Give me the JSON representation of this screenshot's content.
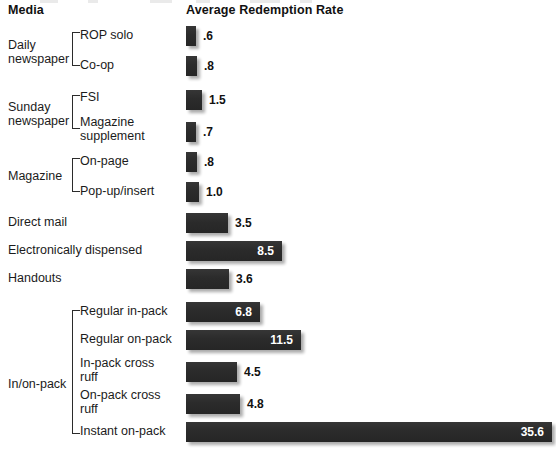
{
  "header": {
    "media_label": "Media",
    "value_label": "Average Redemption Rate"
  },
  "chart_data": {
    "type": "bar",
    "orientation": "horizontal",
    "title": "Average Redemption Rate",
    "xlabel": "Average Redemption Rate",
    "ylabel": "Media",
    "xlim": [
      0,
      36
    ],
    "grid": false,
    "legend": null,
    "bar_color": "#2d2d2d",
    "inside_label_color": "#ffffff",
    "outside_label_color": "#111111",
    "categories": [
      "ROP solo",
      "Co-op",
      "FSI",
      "Magazine supplement",
      "On-page",
      "Pop-up/insert",
      "Direct mail",
      "Electronically dispensed",
      "Handouts",
      "Regular in-pack",
      "Regular on-pack",
      "In-pack cross ruff",
      "On-pack cross ruff",
      "Instant on-pack"
    ],
    "values": [
      0.6,
      0.8,
      1.5,
      0.7,
      0.8,
      1.0,
      3.5,
      8.5,
      3.6,
      6.8,
      11.5,
      4.5,
      4.8,
      35.6
    ],
    "value_labels": [
      ".6",
      ".8",
      "1.5",
      ".7",
      ".8",
      "1.0",
      "3.5",
      "8.5",
      "3.6",
      "6.8",
      "11.5",
      "4.5",
      "4.8",
      "35.6"
    ],
    "groups": [
      {
        "label": "Daily\nnewspaper",
        "members": [
          "ROP solo",
          "Co-op"
        ]
      },
      {
        "label": "Sunday\nnewspaper",
        "members": [
          "FSI",
          "Magazine supplement"
        ]
      },
      {
        "label": "Magazine",
        "members": [
          "On-page",
          "Pop-up/insert"
        ]
      },
      {
        "label": "In/on-pack",
        "members": [
          "Regular in-pack",
          "Regular on-pack",
          "In-pack cross ruff",
          "On-pack cross ruff",
          "Instant on-pack"
        ]
      }
    ],
    "ungrouped": [
      "Direct mail",
      "Electronically dispensed",
      "Handouts"
    ]
  },
  "rows": [
    {
      "name": "rop-solo",
      "label": "ROP solo",
      "value_label": ".6",
      "indent": "sub",
      "bar_top": 26,
      "bar_width": 10,
      "label_top": 28,
      "inside": false
    },
    {
      "name": "co-op",
      "label": "Co-op",
      "value_label": ".8",
      "indent": "sub",
      "bar_top": 56,
      "bar_width": 11,
      "label_top": 58,
      "inside": false
    },
    {
      "name": "fsi",
      "label": "FSI",
      "value_label": "1.5",
      "indent": "sub",
      "bar_top": 90,
      "bar_width": 16,
      "label_top": 90,
      "inside": false
    },
    {
      "name": "magazine-supplement",
      "label": "Magazine\nsupplement",
      "value_label": ".7",
      "indent": "sub",
      "bar_top": 122,
      "bar_width": 10,
      "label_top": 115,
      "inside": false
    },
    {
      "name": "on-page",
      "label": "On-page",
      "value_label": ".8",
      "indent": "sub",
      "bar_top": 152,
      "bar_width": 11,
      "label_top": 154,
      "inside": false
    },
    {
      "name": "pop-up-insert",
      "label": "Pop-up/insert",
      "value_label": "1.0",
      "indent": "sub",
      "bar_top": 182,
      "bar_width": 13,
      "label_top": 184,
      "inside": false
    },
    {
      "name": "direct-mail",
      "label": "Direct mail",
      "value_label": "3.5",
      "indent": "top",
      "bar_top": 213,
      "bar_width": 42,
      "label_top": 215,
      "inside": false
    },
    {
      "name": "electronically-dispensed",
      "label": "Electronically dispensed",
      "value_label": "8.5",
      "indent": "top",
      "bar_top": 241,
      "bar_width": 96,
      "label_top": 243,
      "inside": true
    },
    {
      "name": "handouts",
      "label": "Handouts",
      "value_label": "3.6",
      "indent": "top",
      "bar_top": 269,
      "bar_width": 43,
      "label_top": 271,
      "inside": false
    },
    {
      "name": "regular-in-pack",
      "label": "Regular in-pack",
      "value_label": "6.8",
      "indent": "sub",
      "bar_top": 302,
      "bar_width": 74,
      "label_top": 304,
      "inside": true
    },
    {
      "name": "regular-on-pack",
      "label": "Regular on-pack",
      "value_label": "11.5",
      "indent": "sub",
      "bar_top": 330,
      "bar_width": 115,
      "label_top": 332,
      "inside": true
    },
    {
      "name": "in-pack-cross-ruff",
      "label": "In-pack cross\nruff",
      "value_label": "4.5",
      "indent": "sub",
      "bar_top": 362,
      "bar_width": 51,
      "label_top": 356,
      "inside": false
    },
    {
      "name": "on-pack-cross-ruff",
      "label": "On-pack cross\nruff",
      "value_label": "4.8",
      "indent": "sub",
      "bar_top": 394,
      "bar_width": 54,
      "label_top": 388,
      "inside": false
    },
    {
      "name": "instant-on-pack",
      "label": "Instant on-pack",
      "value_label": "35.6",
      "indent": "sub",
      "bar_top": 422,
      "bar_width": 366,
      "label_top": 424,
      "inside": true
    }
  ],
  "group_labels": [
    {
      "name": "daily-newspaper",
      "text": "Daily\nnewspaper",
      "top": 38,
      "bracket_top": 32,
      "bracket_height": 34
    },
    {
      "name": "sunday-newspaper",
      "text": "Sunday\nnewspaper",
      "top": 100,
      "bracket_top": 95,
      "bracket_height": 34
    },
    {
      "name": "magazine",
      "text": "Magazine",
      "top": 169,
      "bracket_top": 158,
      "bracket_height": 34
    },
    {
      "name": "in-on-pack",
      "text": "In/on-pack",
      "top": 377,
      "bracket_top": 310,
      "bracket_height": 124
    }
  ]
}
